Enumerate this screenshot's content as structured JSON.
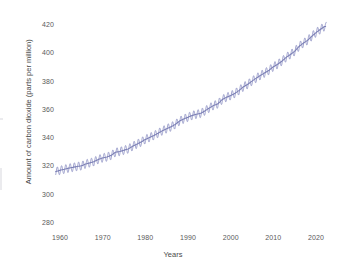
{
  "chart_data": {
    "type": "line",
    "title": "",
    "xlabel": "Years",
    "ylabel": "Amount of carbon dioxide (parts per million)",
    "xlim": [
      1958,
      2023
    ],
    "ylim": [
      276,
      424
    ],
    "xticks": [
      1960,
      1970,
      1980,
      1990,
      2000,
      2010,
      2020
    ],
    "xtick_labels": [
      "1960",
      "1970",
      "1980",
      "1990",
      "2000",
      "2010",
      "2020"
    ],
    "yticks": [
      280,
      300,
      320,
      340,
      360,
      380,
      400,
      420
    ],
    "ytick_labels": [
      "280",
      "300",
      "320",
      "340",
      "360",
      "380",
      "400",
      "420"
    ],
    "grid": false,
    "legend": "none",
    "spines": "none",
    "line_color": "#8f93c4",
    "line_width": 1.0,
    "seasonal_oscillation_amplitude_ppm": 3.0,
    "series": [
      {
        "name": "Atmospheric CO2 (annual mean)",
        "x": [
          1959,
          1960,
          1961,
          1962,
          1963,
          1964,
          1965,
          1966,
          1967,
          1968,
          1969,
          1970,
          1971,
          1972,
          1973,
          1974,
          1975,
          1976,
          1977,
          1978,
          1979,
          1980,
          1981,
          1982,
          1983,
          1984,
          1985,
          1986,
          1987,
          1988,
          1989,
          1990,
          1991,
          1992,
          1993,
          1994,
          1995,
          1996,
          1997,
          1998,
          1999,
          2000,
          2001,
          2002,
          2003,
          2004,
          2005,
          2006,
          2007,
          2008,
          2009,
          2010,
          2011,
          2012,
          2013,
          2014,
          2015,
          2016,
          2017,
          2018,
          2019,
          2020,
          2021,
          2022
        ],
        "values": [
          315.98,
          316.91,
          317.64,
          318.45,
          318.99,
          319.62,
          320.04,
          321.37,
          322.18,
          323.05,
          324.62,
          325.68,
          326.32,
          327.46,
          329.68,
          330.19,
          331.12,
          332.03,
          333.84,
          335.41,
          336.84,
          338.76,
          340.12,
          341.48,
          343.15,
          344.87,
          346.35,
          347.61,
          349.31,
          351.69,
          353.2,
          354.45,
          355.7,
          356.54,
          357.21,
          358.96,
          360.97,
          362.74,
          363.88,
          366.84,
          368.54,
          369.71,
          371.32,
          373.45,
          375.98,
          377.7,
          379.98,
          382.09,
          384.02,
          385.83,
          387.64,
          390.1,
          391.85,
          394.06,
          396.74,
          398.81,
          401.01,
          404.41,
          406.76,
          408.72,
          411.66,
          414.24,
          416.45,
          418.56
        ]
      }
    ]
  },
  "axis": {
    "y_label_text": "Amount of carbon dioxide (parts per million)",
    "x_label_text": "Years"
  }
}
